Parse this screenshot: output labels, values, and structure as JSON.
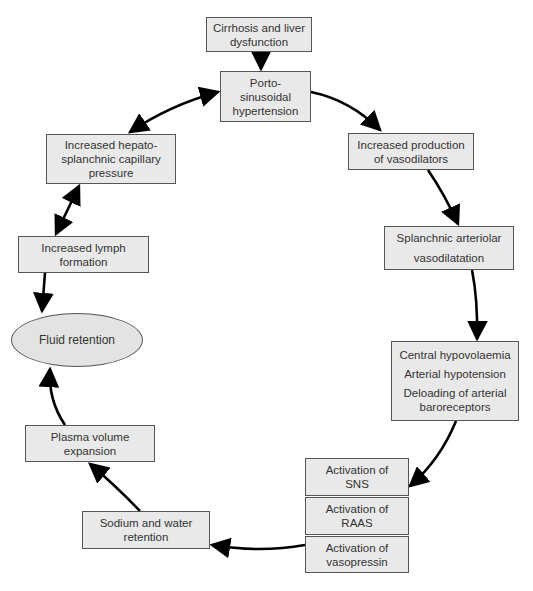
{
  "diagram": {
    "nodes": {
      "cirrhosis": {
        "lines": [
          "Cirrhosis and liver",
          "dysfunction"
        ]
      },
      "porto": {
        "lines": [
          "Porto-",
          "sinusoidal",
          "hypertension"
        ]
      },
      "vasodilators": {
        "lines": [
          "Increased production",
          "of vasodilators"
        ]
      },
      "splanchnic": {
        "lines": [
          "Splanchnic arteriolar",
          "vasodilatation"
        ]
      },
      "central": {
        "lines": [
          "Central hypovolaemia",
          "Arterial hypotension",
          "Deloading of arterial",
          "baroreceptors"
        ]
      },
      "sns": {
        "lines": [
          "Activation of",
          "SNS"
        ]
      },
      "raas": {
        "lines": [
          "Activation of",
          "RAAS"
        ]
      },
      "vasopressin": {
        "lines": [
          "Activation of",
          "vasopressin"
        ]
      },
      "sodium": {
        "lines": [
          "Sodium and water",
          "retention"
        ]
      },
      "plasma": {
        "lines": [
          "Plasma volume",
          "expansion"
        ]
      },
      "fluid": {
        "label": "Fluid retention"
      },
      "lymph": {
        "lines": [
          "Increased lymph",
          "formation"
        ]
      },
      "hepato": {
        "lines": [
          "Increased hepato-",
          "splanchnic capillary",
          "pressure"
        ]
      }
    },
    "edges": [
      {
        "from": "cirrhosis",
        "to": "porto",
        "type": "one-way"
      },
      {
        "from": "porto",
        "to": "vasodilators",
        "type": "one-way"
      },
      {
        "from": "vasodilators",
        "to": "splanchnic",
        "type": "one-way"
      },
      {
        "from": "splanchnic",
        "to": "central",
        "type": "one-way"
      },
      {
        "from": "central",
        "to": "sns",
        "type": "one-way"
      },
      {
        "from": "vasopressin",
        "to": "sodium",
        "type": "one-way"
      },
      {
        "from": "sodium",
        "to": "plasma",
        "type": "one-way"
      },
      {
        "from": "plasma",
        "to": "fluid",
        "type": "one-way"
      },
      {
        "from": "lymph",
        "to": "fluid",
        "type": "one-way"
      },
      {
        "from": "hepato",
        "to": "lymph",
        "type": "two-way"
      },
      {
        "from": "porto",
        "to": "hepato",
        "type": "two-way"
      }
    ],
    "colors": {
      "box_fill": "#e9e9e9",
      "ellipse_fill": "#e3e3e3",
      "border": "#555555",
      "arrow": "#000000"
    }
  }
}
